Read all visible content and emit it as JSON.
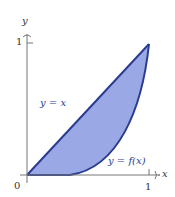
{
  "figure": {
    "axes": {
      "x_label": "x",
      "y_label": "y",
      "origin_label": "0",
      "x_tick": "1",
      "y_tick": "1"
    },
    "curves": [
      {
        "label": "y = x",
        "type": "line"
      },
      {
        "label": "y = f(x)",
        "type": "convex-curve"
      }
    ],
    "region": {
      "description": "area between y = x and y = f(x) from 0 to 1",
      "fill": "#9aa8e6",
      "stroke": "#2a3c8f"
    }
  }
}
